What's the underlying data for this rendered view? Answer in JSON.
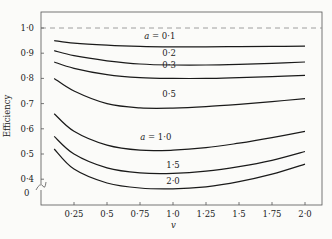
{
  "chart_data": {
    "type": "line",
    "title": "",
    "xlabel": "v",
    "ylabel": "Efficiency",
    "xlim": [
      0,
      2.1
    ],
    "ylim": [
      0.35,
      1.03
    ],
    "y_axis_break": true,
    "y_break_label": "0",
    "grid": false,
    "legend": "inline curve labels",
    "x_ticks": [
      0.25,
      0.5,
      0.75,
      1.0,
      1.25,
      1.5,
      1.75,
      2.0
    ],
    "x_tick_labels": [
      "0·25",
      "0·5",
      "0·75",
      "1·0",
      "1·25",
      "1·5",
      "1·75",
      "2·0"
    ],
    "y_ticks": [
      1.0,
      0.9,
      0.8,
      0.7,
      0.6,
      0.5,
      0.4
    ],
    "y_tick_labels": [
      "1·0",
      "0·9",
      "0·8",
      "0·7",
      "0·6",
      "0·5",
      "0·4"
    ],
    "reference_line": {
      "y": 1.0,
      "style": "dashed"
    },
    "x": [
      0.1,
      0.25,
      0.5,
      0.75,
      1.0,
      1.25,
      1.5,
      1.75,
      2.0
    ],
    "series": [
      {
        "name": "a = 0·1",
        "label": "a = 0·1",
        "label_at": [
          0.9,
          0.955
        ],
        "values": [
          0.95,
          0.94,
          0.932,
          0.927,
          0.925,
          0.925,
          0.926,
          0.927,
          0.928
        ]
      },
      {
        "name": "0·2",
        "label": "0·2",
        "label_at": [
          0.97,
          0.89
        ],
        "values": [
          0.91,
          0.89,
          0.87,
          0.857,
          0.853,
          0.853,
          0.856,
          0.86,
          0.865
        ]
      },
      {
        "name": "0·3",
        "label": "0·3",
        "label_at": [
          0.97,
          0.84
        ],
        "values": [
          0.865,
          0.84,
          0.815,
          0.803,
          0.8,
          0.8,
          0.803,
          0.807,
          0.812
        ]
      },
      {
        "name": "0·5",
        "label": "0·5",
        "label_at": [
          0.97,
          0.725
        ],
        "values": [
          0.8,
          0.75,
          0.7,
          0.683,
          0.682,
          0.688,
          0.697,
          0.708,
          0.72
        ]
      },
      {
        "name": "a = 1·0",
        "label": "a = 1·0",
        "label_at": [
          0.87,
          0.555
        ],
        "values": [
          0.66,
          0.59,
          0.535,
          0.515,
          0.515,
          0.525,
          0.543,
          0.565,
          0.59
        ]
      },
      {
        "name": "1·5",
        "label": "1·5",
        "label_at": [
          1.0,
          0.445
        ],
        "values": [
          0.57,
          0.5,
          0.445,
          0.425,
          0.423,
          0.432,
          0.45,
          0.475,
          0.51
        ]
      },
      {
        "name": "2·0",
        "label": "2·0",
        "label_at": [
          1.0,
          0.38
        ],
        "values": [
          0.52,
          0.44,
          0.385,
          0.365,
          0.362,
          0.37,
          0.39,
          0.42,
          0.46
        ]
      }
    ]
  }
}
